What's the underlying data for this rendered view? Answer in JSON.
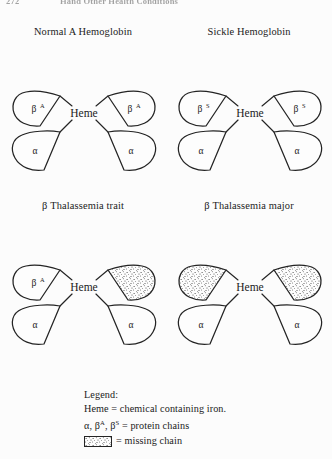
{
  "page": {
    "folio": "272",
    "running_head": "Hand Other Health Conditions",
    "background_color": "#fcfcfc",
    "ink_color": "#242424"
  },
  "panels": [
    {
      "id": "normal-a-hemoglobin",
      "title": "Normal A  Hemoglobin",
      "center_label": "Heme",
      "lobes": [
        {
          "position": "top-left",
          "label": "β",
          "superscript": "A",
          "missing": false
        },
        {
          "position": "top-right",
          "label": "β",
          "superscript": "A",
          "missing": false
        },
        {
          "position": "bottom-left",
          "label": "α",
          "superscript": "",
          "missing": false
        },
        {
          "position": "bottom-right",
          "label": "α",
          "superscript": "",
          "missing": false
        }
      ]
    },
    {
      "id": "sickle-hemoglobin",
      "title": "Sickle Hemoglobin",
      "center_label": "Heme",
      "lobes": [
        {
          "position": "top-left",
          "label": "β",
          "superscript": "S",
          "missing": false
        },
        {
          "position": "top-right",
          "label": "β",
          "superscript": "S",
          "missing": false
        },
        {
          "position": "bottom-left",
          "label": "α",
          "superscript": "",
          "missing": false
        },
        {
          "position": "bottom-right",
          "label": "α",
          "superscript": "",
          "missing": false
        }
      ]
    },
    {
      "id": "beta-thalassemia-trait",
      "title": "β Thalassemia trait",
      "center_label": "Heme",
      "lobes": [
        {
          "position": "top-left",
          "label": "β",
          "superscript": "A",
          "missing": false
        },
        {
          "position": "top-right",
          "label": "",
          "superscript": "",
          "missing": true
        },
        {
          "position": "bottom-left",
          "label": "α",
          "superscript": "",
          "missing": false
        },
        {
          "position": "bottom-right",
          "label": "α",
          "superscript": "",
          "missing": false
        }
      ]
    },
    {
      "id": "beta-thalassemia-major",
      "title": "β Thalassemia major",
      "center_label": "Heme",
      "lobes": [
        {
          "position": "top-left",
          "label": "",
          "superscript": "",
          "missing": true
        },
        {
          "position": "top-right",
          "label": "",
          "superscript": "",
          "missing": true
        },
        {
          "position": "bottom-left",
          "label": "α",
          "superscript": "",
          "missing": false
        },
        {
          "position": "bottom-right",
          "label": "α",
          "superscript": "",
          "missing": false
        }
      ]
    }
  ],
  "legend": {
    "heading": "Legend:",
    "line_heme": "Heme  =  chemical containing iron.",
    "line_chains_pre": "α, β",
    "line_chains_sup1": "A",
    "line_chains_mid": ", β",
    "line_chains_sup2": "S",
    "line_chains_post": "  =  protein chains",
    "line_missing": "=  missing chain"
  }
}
